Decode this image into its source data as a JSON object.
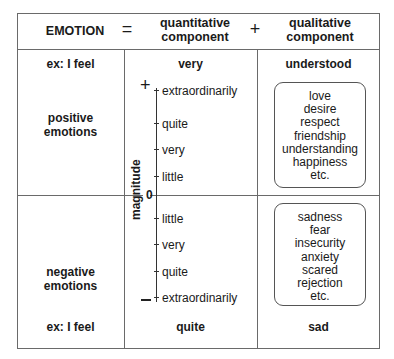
{
  "header": {
    "emotion": "EMOTION",
    "equals": "=",
    "quantitative": "quantitative component",
    "quantitative_line1": "quantitative",
    "quantitative_line2": "component",
    "plus": "+",
    "qualitative_line1": "qualitative",
    "qualitative_line2": "component"
  },
  "top_row": {
    "example": "ex: I feel",
    "quantitative_example": "very",
    "qualitative_example": "understood"
  },
  "positive": {
    "label_line1": "positive",
    "label_line2": "emotions",
    "scale": [
      "extraordinarily",
      "quite",
      "very",
      "little"
    ],
    "qualities": [
      "love",
      "desire",
      "respect",
      "friendship",
      "understanding",
      "happiness",
      "etc."
    ]
  },
  "axis": {
    "label": "magnitude",
    "plus_sign": "+",
    "zero": "0",
    "minus_sign": "–"
  },
  "negative": {
    "label_line1": "negative",
    "label_line2": "emotions",
    "scale": [
      "little",
      "very",
      "quite",
      "extraordinarily"
    ],
    "qualities": [
      "sadness",
      "fear",
      "insecurity",
      "anxiety",
      "scared",
      "rejection",
      "etc."
    ]
  },
  "bottom_row": {
    "example": "ex: I feel",
    "quantitative_example": "quite",
    "qualitative_example": "sad"
  }
}
